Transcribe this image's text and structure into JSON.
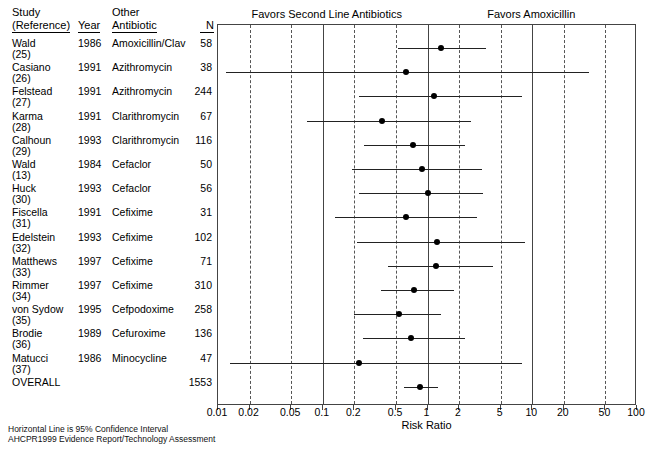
{
  "headers": {
    "study_line1": "Study",
    "study_line2": "(Reference)",
    "year": "Year",
    "antibiotic_line1": "Other",
    "antibiotic_line2": "Antibiotic",
    "n": "N"
  },
  "favors": {
    "left": "Favors Second Line Antibiotics",
    "right": "Favors Amoxicillin"
  },
  "axis": {
    "title": "Risk Ratio",
    "ticks": [
      "0.01",
      "0.02",
      "0.05",
      "0.1",
      "0.2",
      "0.5",
      "1",
      "2",
      "5",
      "10",
      "20",
      "50",
      "100"
    ],
    "min": 0.01,
    "max": 100
  },
  "footnotes": [
    "Horizontal Line is 95% Confidence Interval",
    "AHCPR1999 Evidence Report/Technology Assessment"
  ],
  "chart_data": {
    "type": "forest",
    "title": "",
    "xlabel": "Risk Ratio",
    "ylabel": "",
    "xscale": "log",
    "xlim": [
      0.01,
      100
    ],
    "grid": true,
    "reference_line": 1,
    "tick_values": [
      0.01,
      0.02,
      0.05,
      0.1,
      0.2,
      0.5,
      1,
      2,
      5,
      10,
      20,
      50,
      100
    ],
    "tick_labels": [
      "0.01",
      "0.02",
      "0.05",
      "0.1",
      "0.2",
      "0.5",
      "1",
      "2",
      "5",
      "10",
      "20",
      "50",
      "100"
    ],
    "annotations": [
      "Favors Second Line Antibiotics",
      "Favors Amoxicillin"
    ],
    "rows": [
      {
        "study": "Wald",
        "ref": "(25)",
        "year": "1986",
        "antibiotic": "Amoxicillin/Clav",
        "n": "58",
        "rr": 1.35,
        "lo": 0.52,
        "hi": 3.6
      },
      {
        "study": "Casiano",
        "ref": "(26)",
        "year": "1991",
        "antibiotic": "Azithromycin",
        "n": "38",
        "rr": 0.62,
        "lo": 0.012,
        "hi": 35
      },
      {
        "study": "Felstead",
        "ref": "(27)",
        "year": "1991",
        "antibiotic": "Azithromycin",
        "n": "244",
        "rr": 1.15,
        "lo": 0.22,
        "hi": 8.0
      },
      {
        "study": "Karma",
        "ref": "(28)",
        "year": "1991",
        "antibiotic": "Clarithromycin",
        "n": "67",
        "rr": 0.37,
        "lo": 0.07,
        "hi": 2.6
      },
      {
        "study": "Calhoun",
        "ref": "(29)",
        "year": "1993",
        "antibiotic": "Clarithromycin",
        "n": "116",
        "rr": 0.72,
        "lo": 0.25,
        "hi": 2.3
      },
      {
        "study": "Wald",
        "ref": "(13)",
        "year": "1984",
        "antibiotic": "Cefaclor",
        "n": "50",
        "rr": 0.88,
        "lo": 0.19,
        "hi": 3.3
      },
      {
        "study": "Huck",
        "ref": "(30)",
        "year": "1993",
        "antibiotic": "Cefaclor",
        "n": "56",
        "rr": 1.0,
        "lo": 0.22,
        "hi": 3.4
      },
      {
        "study": "Fiscella",
        "ref": "(31)",
        "year": "1991",
        "antibiotic": "Cefixime",
        "n": "31",
        "rr": 0.62,
        "lo": 0.13,
        "hi": 3.0
      },
      {
        "study": "Edelstein",
        "ref": "(32)",
        "year": "1993",
        "antibiotic": "Cefixime",
        "n": "102",
        "rr": 1.22,
        "lo": 0.21,
        "hi": 8.5
      },
      {
        "study": "Matthews",
        "ref": "(33)",
        "year": "1997",
        "antibiotic": "Cefixime",
        "n": "71",
        "rr": 1.2,
        "lo": 0.42,
        "hi": 4.2
      },
      {
        "study": "Rimmer",
        "ref": "(34)",
        "year": "1997",
        "antibiotic": "Cefixime",
        "n": "310",
        "rr": 0.75,
        "lo": 0.36,
        "hi": 1.8
      },
      {
        "study": "von Sydow",
        "ref": "(35)",
        "year": "1995",
        "antibiotic": "Cefpodoxime",
        "n": "258",
        "rr": 0.54,
        "lo": 0.2,
        "hi": 1.35
      },
      {
        "study": "Brodie",
        "ref": "(36)",
        "year": "1989",
        "antibiotic": "Cefuroxime",
        "n": "136",
        "rr": 0.7,
        "lo": 0.24,
        "hi": 2.3
      },
      {
        "study": "Matucci",
        "ref": "(37)",
        "year": "1986",
        "antibiotic": "Minocycline",
        "n": "47",
        "rr": 0.22,
        "lo": 0.013,
        "hi": 8.0
      },
      {
        "study": "OVERALL",
        "ref": "",
        "year": "",
        "antibiotic": "",
        "n": "1553",
        "rr": 0.85,
        "lo": 0.6,
        "hi": 1.25
      }
    ]
  }
}
